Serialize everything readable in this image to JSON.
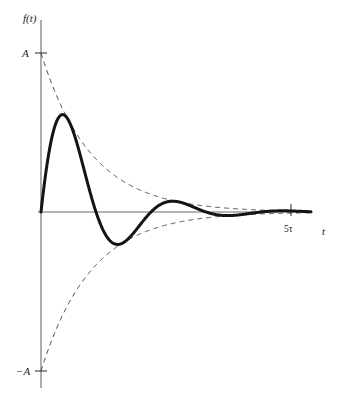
{
  "figure": {
    "background_color": "#ffffff",
    "width": 341,
    "height": 394
  },
  "axes": {
    "y_axis": {
      "name": "vertical-axis",
      "label": "f(t)",
      "color": "#6b6b6b",
      "x_px": 41,
      "y_top_px": 20,
      "y_bottom_px": 388
    },
    "x_axis": {
      "name": "horizontal-axis",
      "label": "t",
      "color": "#6b6b6b",
      "y_px": 212,
      "x_left_px": 38,
      "x_right_px": 310
    },
    "ticks": [
      {
        "axis": "y",
        "label": "A",
        "value": 1,
        "y_px": 53
      },
      {
        "axis": "y",
        "label": "−A",
        "value": -1,
        "y_px": 371
      },
      {
        "axis": "x",
        "label": "5τ",
        "value": 5,
        "x_px": 291
      }
    ]
  },
  "chart_data": {
    "type": "line",
    "title": "",
    "xlabel": "t",
    "ylabel": "f(t)",
    "xlim": [
      0,
      5.4
    ],
    "ylim": [
      -1,
      1
    ],
    "grid": false,
    "legend": "none",
    "x_unit": "tau",
    "y_unit": "A",
    "equation": "f(t) = A e^(-t/tau) sin(2 pi t / 2.2 tau)",
    "parameters": {
      "amplitude_A": 1,
      "time_constant_tau": 1,
      "period_in_tau": 2.2,
      "decay_exponent": -1
    },
    "series": [
      {
        "name": "damped-signal",
        "style": "solid",
        "color": "#141414",
        "linewidth": 3.0,
        "description": "A*exp(-t/tau)*sin(2*pi*t/2.2tau)",
        "key_points": [
          {
            "label": "origin",
            "t": 0.0,
            "f": 0.0
          },
          {
            "label": "peak-1",
            "t": 0.74,
            "f": 0.74
          },
          {
            "label": "zero-1",
            "t": 1.1,
            "f": 0.0
          },
          {
            "label": "trough-1",
            "t": 1.84,
            "f": -0.44
          },
          {
            "label": "zero-2",
            "t": 2.2,
            "f": 0.0
          },
          {
            "label": "peak-2",
            "t": 2.94,
            "f": 0.26
          },
          {
            "label": "zero-3",
            "t": 3.3,
            "f": 0.0
          },
          {
            "label": "trough-2",
            "t": 4.04,
            "f": -0.156
          },
          {
            "label": "zero-4",
            "t": 4.4,
            "f": 0.0
          },
          {
            "label": "peak-3",
            "t": 5.14,
            "f": 0.092
          },
          {
            "label": "zero-5",
            "t": 5.5,
            "f": 0.0
          }
        ]
      },
      {
        "name": "upper-envelope",
        "style": "dashed",
        "color": "#4a4a4a",
        "linewidth": 1.0,
        "description": "+A*exp(-t/tau)",
        "key_points": [
          {
            "t": 0.0,
            "f": 1.0
          },
          {
            "t": 1.0,
            "f": 0.368
          },
          {
            "t": 2.0,
            "f": 0.135
          },
          {
            "t": 3.0,
            "f": 0.05
          },
          {
            "t": 4.0,
            "f": 0.018
          },
          {
            "t": 5.0,
            "f": 0.007
          }
        ]
      },
      {
        "name": "lower-envelope",
        "style": "dashed",
        "color": "#4a4a4a",
        "linewidth": 1.0,
        "description": "-A*exp(-t/tau)",
        "key_points": [
          {
            "t": 0.0,
            "f": -1.0
          },
          {
            "t": 1.0,
            "f": -0.368
          },
          {
            "t": 2.0,
            "f": -0.135
          },
          {
            "t": 3.0,
            "f": -0.05
          },
          {
            "t": 4.0,
            "f": -0.018
          },
          {
            "t": 5.0,
            "f": -0.007
          }
        ]
      }
    ],
    "annotations": [
      {
        "text": "f(t)",
        "role": "y-axis-label"
      },
      {
        "text": "t",
        "role": "x-axis-label"
      },
      {
        "text": "A",
        "role": "positive-amplitude-tick"
      },
      {
        "text": "−A",
        "role": "negative-amplitude-tick"
      },
      {
        "text": "5τ",
        "role": "time-axis-tick"
      }
    ]
  },
  "labels": {
    "y_axis_label": "f(t)",
    "x_axis_label": "t",
    "amplitude_positive": "A",
    "amplitude_negative": "−A",
    "time_tick": "5τ"
  },
  "colors": {
    "curve": "#141414",
    "envelope": "#4a4a4a",
    "axis": "#6b6b6b",
    "text": "#1a1a1a",
    "background": "#ffffff"
  }
}
